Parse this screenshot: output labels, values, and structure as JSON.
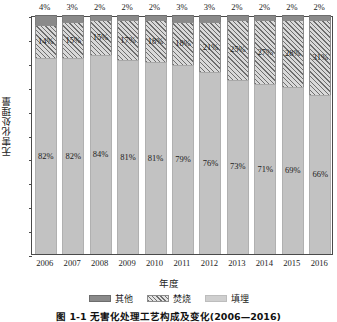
{
  "chart_data": {
    "type": "bar",
    "subtype": "stacked-percentage",
    "title": "",
    "xlabel": "年度",
    "ylabel": "无害化处理量",
    "categories": [
      "2006",
      "2007",
      "2008",
      "2009",
      "2010",
      "2011",
      "2012",
      "2013",
      "2014",
      "2015",
      "2016"
    ],
    "series": [
      {
        "name": "其他",
        "position": "top",
        "values": [
          4,
          3,
          2,
          2,
          2,
          3,
          3,
          2,
          2,
          2,
          2
        ],
        "labels": [
          "4%",
          "3%",
          "2%",
          "2%",
          "2%",
          "3%",
          "3%",
          "2%",
          "2%",
          "2%",
          "2%"
        ],
        "color": "#8a8a8a",
        "fill": "solid"
      },
      {
        "name": "焚烧",
        "position": "middle",
        "values": [
          14,
          15,
          15,
          17,
          18,
          18,
          21,
          25,
          27,
          28,
          31
        ],
        "labels": [
          "14%",
          "15%",
          "15%",
          "17%",
          "18%",
          "18%",
          "21%",
          "25%",
          "27%",
          "28%",
          "31%"
        ],
        "color": "#d9d9d9",
        "fill": "hatched-diagonal"
      },
      {
        "name": "填埋",
        "position": "bottom",
        "values": [
          82,
          82,
          84,
          81,
          81,
          79,
          76,
          73,
          71,
          69,
          66
        ],
        "labels": [
          "82%",
          "82%",
          "84%",
          "81%",
          "81%",
          "79%",
          "76%",
          "73%",
          "71%",
          "69%",
          "66%"
        ],
        "color": "#c2c2c2",
        "fill": "solid"
      }
    ],
    "ylim": [
      0,
      100
    ],
    "y_tick_labels": [],
    "y_tick_count": 11,
    "grid": false,
    "legend_position": "bottom",
    "legend_entries": [
      "其他",
      "焚烧",
      "填埋"
    ]
  },
  "caption": {
    "text": "图 1-1  无害化处理工艺构成及变化(2006—2016)"
  }
}
